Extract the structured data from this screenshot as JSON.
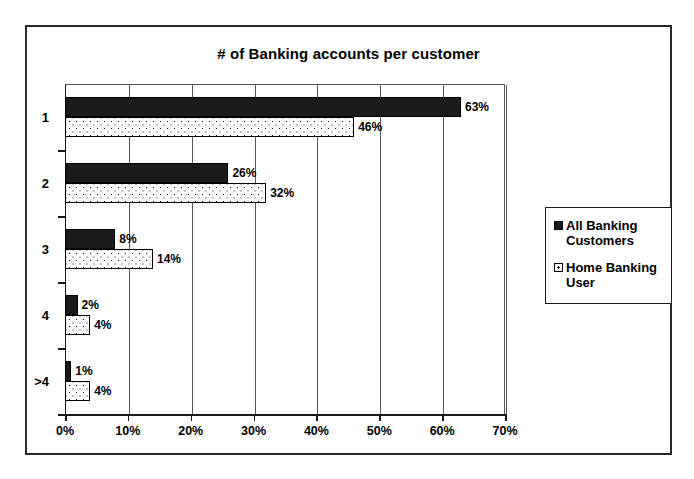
{
  "chart_data": {
    "type": "bar",
    "orientation": "horizontal",
    "title": "# of Banking accounts per customer",
    "xlabel": "",
    "ylabel": "",
    "categories": [
      "1",
      "2",
      "3",
      "4",
      ">4"
    ],
    "series": [
      {
        "name": "All Banking Customers",
        "values": [
          63,
          26,
          8,
          2,
          1
        ],
        "labels": [
          "63%",
          "26%",
          "8%",
          "2%",
          "1%"
        ],
        "fill": "solid-black",
        "color": "#1a1a1a"
      },
      {
        "name": "Home Banking User",
        "values": [
          46,
          32,
          14,
          4,
          4
        ],
        "labels": [
          "46%",
          "32%",
          "14%",
          "4%",
          "4%"
        ],
        "fill": "dotted-white",
        "color": "#ffffff"
      }
    ],
    "xlim": [
      0,
      70
    ],
    "xticks": [
      0,
      10,
      20,
      30,
      40,
      50,
      60,
      70
    ],
    "xtick_labels": [
      "0%",
      "10%",
      "20%",
      "30%",
      "40%",
      "50%",
      "60%",
      "70%"
    ],
    "grid": "vertical",
    "legend_position": "right"
  },
  "legend": {
    "entries": [
      {
        "label": "All Banking Customers"
      },
      {
        "label": "Home Banking User"
      }
    ]
  }
}
